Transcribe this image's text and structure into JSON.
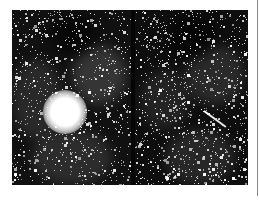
{
  "figure": {
    "panels": [
      {
        "id": "left",
        "label": "",
        "features": [
          "bright saturated star",
          "dense star field",
          "nebula filaments upper-right"
        ],
        "bright_star": {
          "x": 53,
          "y": 102,
          "radius": 22
        }
      },
      {
        "id": "right",
        "label": "",
        "features": [
          "dense star field",
          "nebula filaments",
          "linear streak"
        ],
        "streak": {
          "x1": 69,
          "y1": 100,
          "x2": 91,
          "y2": 116
        }
      }
    ],
    "colors": {
      "background": "#ffffff",
      "sky": "#0e0e0e",
      "star": "#ffffff",
      "edge_line": "#8a8a8a"
    }
  }
}
